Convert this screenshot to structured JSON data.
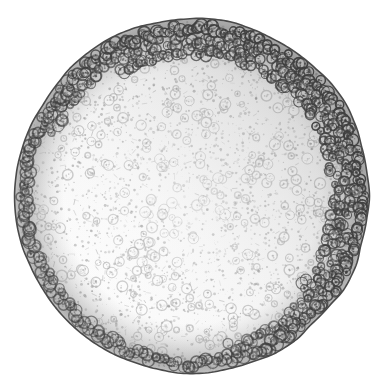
{
  "figure": {
    "title": "Spherical cellular embryo (blastula) whole mount",
    "modality": "light-micrograph-halftone",
    "caption": "",
    "canvas": {
      "width": 385,
      "height": 388,
      "background": "#ffffff"
    },
    "sphere": {
      "center_x": 193,
      "center_y": 196,
      "radius": 177,
      "outline_color": "#4a4a4a",
      "outline_width": 1.6,
      "irregularity": 0.022,
      "lobes": 46
    },
    "interior": {
      "fill_color": "#fbfbfb",
      "speckle_color": "#8e8e8e",
      "speckle_count": 2600,
      "speckle_min_r": 0.35,
      "speckle_max_r": 1.5,
      "blob_color": "#9a9a9a",
      "blob_count": 300,
      "blob_min_r": 2.6,
      "blob_max_r": 5.6,
      "haze_color": "#d9d9d9"
    },
    "peripheral_layer": {
      "name": "blastoderm-cell-ring",
      "cell_count": 330,
      "cell_min_r": 3.4,
      "cell_max_r": 6.6,
      "ring_color": "#3f3f3f",
      "lumen_color": "#c6c6c6",
      "band_inner_fraction": 0.8,
      "band_outer_fraction": 0.995,
      "darkest_sector_deg": 320,
      "darkest_sector_label": "upper-right"
    },
    "shading": {
      "band_color": "#a8a8a8",
      "band_opacity": 0.55,
      "gradient_light_angle_deg": 215
    },
    "palette": {
      "white": "#ffffff",
      "near_white": "#fbfbfb",
      "light_gray": "#d9d9d9",
      "mid_gray": "#9a9a9a",
      "dark_gray": "#4a4a4a",
      "near_black": "#2e2e2e"
    },
    "seed": 20240917
  }
}
